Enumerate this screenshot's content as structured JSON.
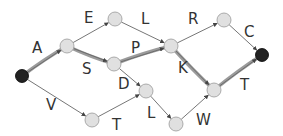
{
  "diagram": {
    "type": "directed-graph",
    "colors": {
      "edge": "#666666",
      "highlight": "#8a8a8a",
      "node_fill": "#e0e0e0",
      "node_stroke": "#999999",
      "terminal_fill": "#222222",
      "label": "#333333"
    },
    "nodes": [
      {
        "id": "start",
        "x": 22,
        "y": 76,
        "kind": "terminal"
      },
      {
        "id": "n1",
        "x": 67,
        "y": 46,
        "kind": "state"
      },
      {
        "id": "n2",
        "x": 115,
        "y": 19,
        "kind": "state"
      },
      {
        "id": "n3",
        "x": 114,
        "y": 64,
        "kind": "state"
      },
      {
        "id": "n4",
        "x": 171,
        "y": 46,
        "kind": "state"
      },
      {
        "id": "n5",
        "x": 224,
        "y": 20,
        "kind": "state"
      },
      {
        "id": "end",
        "x": 262,
        "y": 55,
        "kind": "terminal"
      },
      {
        "id": "n6",
        "x": 146,
        "y": 91,
        "kind": "state"
      },
      {
        "id": "n7",
        "x": 92,
        "y": 120,
        "kind": "state"
      },
      {
        "id": "n8",
        "x": 176,
        "y": 124,
        "kind": "state"
      },
      {
        "id": "n9",
        "x": 214,
        "y": 90,
        "kind": "state"
      }
    ],
    "edges": [
      {
        "from": "start",
        "to": "n1",
        "label": "A",
        "lx": 32,
        "ly": 53
      },
      {
        "from": "n1",
        "to": "n2",
        "label": "E",
        "lx": 84,
        "ly": 23
      },
      {
        "from": "n1",
        "to": "n3",
        "label": "S",
        "lx": 82,
        "ly": 74
      },
      {
        "from": "n2",
        "to": "n4",
        "label": "L",
        "lx": 141,
        "ly": 24
      },
      {
        "from": "n3",
        "to": "n4",
        "label": "P",
        "lx": 131,
        "ly": 53
      },
      {
        "from": "n4",
        "to": "n5",
        "label": "R",
        "lx": 188,
        "ly": 24
      },
      {
        "from": "n5",
        "to": "end",
        "label": "C",
        "lx": 244,
        "ly": 37
      },
      {
        "from": "n3",
        "to": "n6",
        "label": "D",
        "lx": 118,
        "ly": 89
      },
      {
        "from": "start",
        "to": "n7",
        "label": "V",
        "lx": 46,
        "ly": 110
      },
      {
        "from": "n7",
        "to": "n6",
        "label": "T",
        "lx": 112,
        "ly": 130
      },
      {
        "from": "n6",
        "to": "n8",
        "label": "L",
        "lx": 147,
        "ly": 118
      },
      {
        "from": "n8",
        "to": "n9",
        "label": "W",
        "lx": 196,
        "ly": 125
      },
      {
        "from": "n4",
        "to": "n9",
        "label": "K",
        "lx": 178,
        "ly": 73
      },
      {
        "from": "n9",
        "to": "end",
        "label": "T",
        "lx": 240,
        "ly": 90
      }
    ],
    "highlighted_path": [
      "start",
      "n1",
      "n3",
      "n4",
      "n9",
      "end"
    ]
  }
}
